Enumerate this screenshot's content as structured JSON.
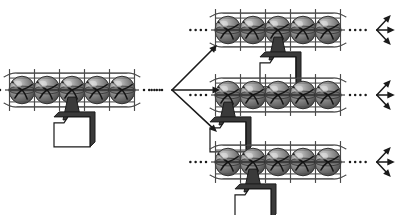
{
  "figure": {
    "title": "Branching chain diagram",
    "background_color": "#ffffff",
    "ink_color": "#1a1a1a",
    "sphere_fill_dark": "#6e6e6e",
    "sphere_fill_light": "#b9b9b9",
    "cage_color": "#4a4a4a",
    "folder_fill": "#ffffff",
    "folder_shadow": "#3a3a3a"
  },
  "chains": [
    {
      "id": "source-chain",
      "name": "source chain",
      "x": 22,
      "y": 90,
      "sphere_count": 5,
      "sphere_spacing": 25,
      "sphere_radius": 13,
      "marker_index": 2,
      "marker_side": "center",
      "marker_label": "folder marker",
      "lead_dots": 4,
      "trail_dots": 4,
      "terminator": "none"
    },
    {
      "id": "variant-chain-top",
      "name": "top variant chain",
      "x": 228,
      "y": 30,
      "sphere_count": 5,
      "sphere_spacing": 25,
      "sphere_radius": 13,
      "marker_index": 2,
      "marker_side": "center",
      "marker_label": "folder marker",
      "lead_dots": 4,
      "trail_dots": 4,
      "terminator": "fan"
    },
    {
      "id": "variant-chain-middle",
      "name": "middle variant chain",
      "x": 228,
      "y": 95,
      "sphere_count": 5,
      "sphere_spacing": 25,
      "sphere_radius": 13,
      "marker_index": 0,
      "marker_side": "left",
      "marker_label": "folder marker",
      "lead_dots": 4,
      "trail_dots": 4,
      "terminator": "fan"
    },
    {
      "id": "variant-chain-bottom",
      "name": "bottom variant chain",
      "x": 228,
      "y": 162,
      "sphere_count": 5,
      "sphere_spacing": 25,
      "sphere_radius": 13,
      "marker_index": 1,
      "marker_side": "center",
      "marker_label": "folder marker",
      "lead_dots": 4,
      "trail_dots": 4,
      "terminator": "fan"
    }
  ],
  "branch": {
    "name": "three-way branch arrow",
    "origin_x": 172,
    "origin_y": 90,
    "lead_dots": 3,
    "arms": [
      {
        "label": "upper branch",
        "dx": 45,
        "dy": -45
      },
      {
        "label": "middle branch",
        "dx": 48,
        "dy": 0
      },
      {
        "label": "lower branch",
        "dx": 45,
        "dy": 42
      }
    ]
  },
  "terminator_fan": {
    "name": "three arrow fan",
    "arms": [
      {
        "label": "up arrow",
        "dx": 14,
        "dy": -15
      },
      {
        "label": "straight arrow",
        "dx": 18,
        "dy": 0
      },
      {
        "label": "down arrow",
        "dx": 14,
        "dy": 15
      }
    ]
  }
}
